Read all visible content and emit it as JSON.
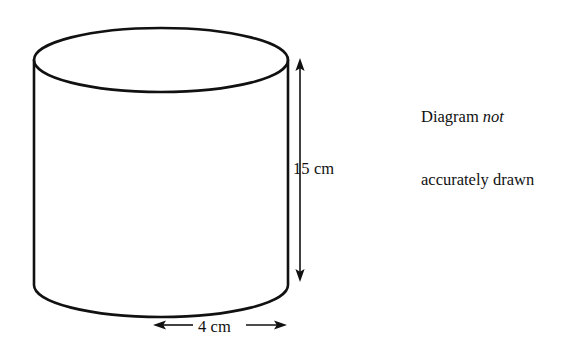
{
  "figure": {
    "type": "cylinder-diagram",
    "background_color": "#ffffff",
    "stroke_color": "#111111",
    "fill": "none",
    "shape": {
      "name": "cylinder",
      "left_x": 34,
      "right_x": 288,
      "top_ellipse_center_y": 60,
      "bottom_ellipse_center_y": 285,
      "ellipse_rx": 127,
      "ellipse_ry": 32
    }
  },
  "annotations": {
    "height_dimension": {
      "label": "15 cm",
      "value": 15,
      "unit": "cm",
      "orientation": "vertical",
      "arrow_style": "double-headed",
      "x": 300,
      "y_top": 60,
      "y_bottom": 280
    },
    "width_dimension": {
      "label": "4 cm",
      "value": 4,
      "unit": "cm",
      "orientation": "horizontal",
      "arrow_style": "double-headed",
      "y": 325,
      "x_left": 155,
      "x_right": 285
    }
  },
  "note": {
    "line1_prefix": "Diagram ",
    "line1_emphasis": "not",
    "line2": "accurately drawn"
  }
}
